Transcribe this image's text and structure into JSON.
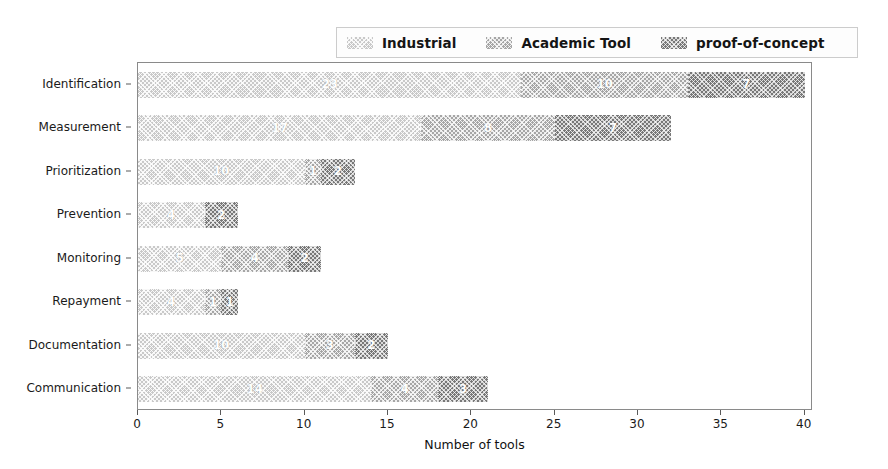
{
  "chart_data": {
    "type": "bar",
    "orientation": "horizontal",
    "stacked": true,
    "title": "",
    "xlabel": "Number of tools",
    "ylabel": "",
    "xlim": [
      0,
      40.5
    ],
    "xticks": [
      0,
      5,
      10,
      15,
      20,
      25,
      30,
      35,
      40
    ],
    "grid": false,
    "legend_position": "upper right",
    "categories": [
      "Identification",
      "Measurement",
      "Prioritization",
      "Prevention",
      "Monitoring",
      "Repayment",
      "Documentation",
      "Communication"
    ],
    "series": [
      {
        "name": "Industrial",
        "color": "#c9c9c9",
        "values": [
          23,
          17,
          10,
          4,
          5,
          4,
          10,
          14
        ],
        "labels": [
          "23",
          "17",
          "10",
          "4",
          "5",
          "4",
          "10",
          "14"
        ]
      },
      {
        "name": "Academic Tool",
        "color": "#a6a6a6",
        "values": [
          10,
          8,
          1,
          0,
          4,
          1,
          3,
          4
        ],
        "labels": [
          "10",
          "8",
          "1",
          "",
          "4",
          "1",
          "3",
          "4"
        ]
      },
      {
        "name": "proof-of-concept",
        "color": "#787878",
        "values": [
          7,
          7,
          2,
          2,
          2,
          1,
          2,
          3
        ],
        "labels": [
          "7",
          "7",
          "2",
          "2",
          "2",
          "1",
          "2",
          "3"
        ]
      }
    ],
    "totals": [
      40,
      32,
      13,
      6,
      11,
      6,
      15,
      21
    ]
  },
  "legend": {
    "entries": [
      {
        "label": "Industrial"
      },
      {
        "label": "Academic Tool"
      },
      {
        "label": "proof-of-concept"
      }
    ]
  },
  "axis": {
    "x_title": "Number of tools",
    "x_tick_labels": [
      "0",
      "5",
      "10",
      "15",
      "20",
      "25",
      "30",
      "35",
      "40"
    ],
    "y_tick_labels": [
      "Identification",
      "Measurement",
      "Prioritization",
      "Prevention",
      "Monitoring",
      "Repayment",
      "Documentation",
      "Communication"
    ]
  }
}
